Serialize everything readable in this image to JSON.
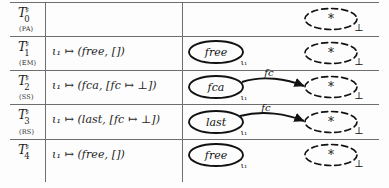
{
  "figure": {
    "kind": "transition-table",
    "columns": [
      "state",
      "environment",
      "heap-graph"
    ],
    "colors": {
      "ink": "#111111",
      "rule": "#6e6e6e",
      "paper": "#fdfdfd"
    },
    "symbols": {
      "sharp": "♯",
      "mapsto": "↦",
      "bottom": "⊥",
      "star": "*",
      "iota": "ι"
    }
  },
  "rows": [
    {
      "state": {
        "base": "T",
        "sub": "0",
        "sup": "♯"
      },
      "rule": "(PA)",
      "formula": "",
      "graph": {
        "solid_node": null,
        "solid_sub": "",
        "edge_label": "",
        "has_edge": false,
        "dashed_node": "*",
        "dashed_sub": "⊥"
      }
    },
    {
      "state": {
        "base": "T",
        "sub": "1",
        "sup": "♯"
      },
      "rule": "(EM)",
      "formula": "ι₁ ↦ (free, [])",
      "graph": {
        "solid_node": "free",
        "solid_sub": "ι₁",
        "edge_label": "",
        "has_edge": false,
        "dashed_node": "*",
        "dashed_sub": "⊥"
      }
    },
    {
      "state": {
        "base": "T",
        "sub": "2",
        "sup": "♯"
      },
      "rule": "(SS)",
      "formula": "ι₁ ↦ (fca, [fc ↦ ⊥])",
      "graph": {
        "solid_node": "fca",
        "solid_sub": "ι₁",
        "edge_label": "fc",
        "has_edge": true,
        "dashed_node": "*",
        "dashed_sub": "⊥"
      }
    },
    {
      "state": {
        "base": "T",
        "sub": "3",
        "sup": "♯"
      },
      "rule": "(RS)",
      "formula": "ι₁ ↦ (last, [fc ↦ ⊥])",
      "graph": {
        "solid_node": "last",
        "solid_sub": "ι₁",
        "edge_label": "fc",
        "has_edge": true,
        "dashed_node": "*",
        "dashed_sub": "⊥"
      }
    },
    {
      "state": {
        "base": "T",
        "sub": "4",
        "sup": "♯"
      },
      "rule": "",
      "formula": "ι₁ ↦ (free, [])",
      "graph": {
        "solid_node": "free",
        "solid_sub": "ι₁",
        "edge_label": "",
        "has_edge": false,
        "dashed_node": "*",
        "dashed_sub": "⊥"
      }
    }
  ]
}
